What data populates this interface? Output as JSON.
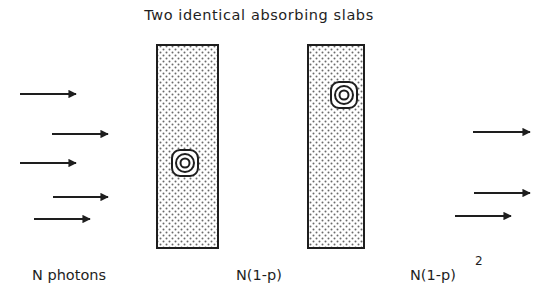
{
  "title": "Two identical absorbing slabs",
  "labels": {
    "incident": "N photons",
    "after_slab1": "N(1-p)",
    "after_slab2": "N(1-p)",
    "after_slab2_exponent": "2"
  },
  "slabs": [
    {
      "name": "slab-1",
      "x": 157,
      "y": 45,
      "width": 61,
      "height": 203,
      "absorber": {
        "cx": 185,
        "cy": 163
      }
    },
    {
      "name": "slab-2",
      "x": 308,
      "y": 45,
      "width": 56,
      "height": 203,
      "absorber": {
        "cx": 344,
        "cy": 95
      }
    }
  ],
  "incident_arrows": [
    {
      "x1": 20,
      "x2": 76,
      "y": 94
    },
    {
      "x1": 52,
      "x2": 108,
      "y": 134
    },
    {
      "x1": 20,
      "x2": 76,
      "y": 163
    },
    {
      "x1": 53,
      "x2": 108,
      "y": 197
    },
    {
      "x1": 34,
      "x2": 90,
      "y": 219
    }
  ],
  "transmitted_arrows": [
    {
      "x1": 473,
      "x2": 530,
      "y": 132
    },
    {
      "x1": 474,
      "x2": 530,
      "y": 193
    },
    {
      "x1": 455,
      "x2": 511,
      "y": 216
    }
  ],
  "colors": {
    "ink": "#1e1e1e",
    "dots": "#6a6a6a",
    "background": "#ffffff"
  }
}
